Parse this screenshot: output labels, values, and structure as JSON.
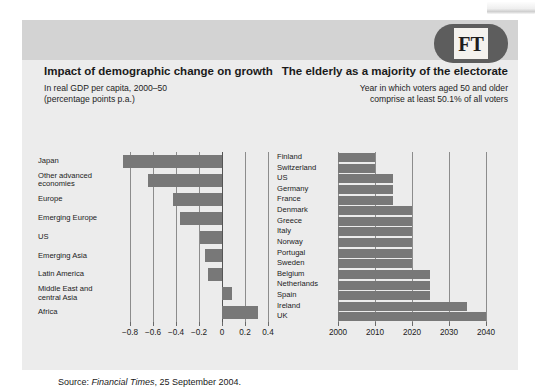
{
  "brand": {
    "logo_text": "FT",
    "logo_name": "financial-times-logo"
  },
  "source_note": {
    "prefix": "Source:",
    "publication": "Financial Times",
    "rest": ", 25 September 2004."
  },
  "chart_data": [
    {
      "id": "impact-of-demographic-change-on-growth",
      "type": "bar",
      "orientation": "horizontal",
      "title": "Impact of demographic change on growth",
      "subtitle": "In real GDP per capita, 2000–50 (percentage points p.a.)",
      "subtitle_lines": [
        "In real GDP per capita, 2000–50",
        "(percentage points p.a.)"
      ],
      "xlabel": "",
      "ylabel": "",
      "xlim": [
        -0.9,
        0.45
      ],
      "grid": true,
      "legend": "none",
      "bar_color": "#787878",
      "ticks": [
        -0.8,
        -0.6,
        -0.4,
        -0.2,
        0,
        0.2,
        0.4
      ],
      "tick_labels": [
        "−0.8",
        "−0.6",
        "−0.4",
        "−0.2",
        "0",
        "0.2",
        "0.4"
      ],
      "categories": [
        "Japan",
        "Other advanced economies",
        "Europe",
        "Emerging Europe",
        "US",
        "Emerging Asia",
        "Latin America",
        "Middle East and central Asia",
        "Africa"
      ],
      "category_lines": [
        [
          "Japan"
        ],
        [
          "Other advanced",
          "economies"
        ],
        [
          "Europe"
        ],
        [
          "Emerging Europe"
        ],
        [
          "US"
        ],
        [
          "Emerging Asia"
        ],
        [
          "Latin America"
        ],
        [
          "Middle East and",
          "central Asia"
        ],
        [
          "Africa"
        ]
      ],
      "values": [
        -0.86,
        -0.64,
        -0.42,
        -0.36,
        -0.19,
        -0.15,
        -0.12,
        0.09,
        0.31
      ]
    },
    {
      "id": "the-elderly-as-a-majority-of-the-electorate",
      "type": "bar",
      "orientation": "horizontal",
      "title": "The elderly as a majority of the electorate",
      "subtitle": "Year in which voters aged 50 and older comprise at least 50.1% of all voters",
      "subtitle_lines": [
        "Year in which voters aged 50 and older",
        "comprise at least 50.1% of all voters"
      ],
      "xlabel": "",
      "ylabel": "",
      "xlim": [
        2000,
        2042
      ],
      "grid": true,
      "legend": "none",
      "bar_color": "#787878",
      "ticks": [
        2000,
        2010,
        2020,
        2030,
        2040
      ],
      "tick_labels": [
        "2000",
        "2010",
        "2020",
        "2030",
        "2040"
      ],
      "categories": [
        "Finland",
        "Switzerland",
        "US",
        "Germany",
        "France",
        "Denmark",
        "Greece",
        "Italy",
        "Norway",
        "Portugal",
        "Sweden",
        "Belgium",
        "Netherlands",
        "Spain",
        "Ireland",
        "UK"
      ],
      "values": [
        2010,
        2010,
        2015,
        2015,
        2015,
        2020,
        2020,
        2020,
        2020,
        2020,
        2020,
        2025,
        2025,
        2025,
        2035,
        2040
      ]
    }
  ]
}
